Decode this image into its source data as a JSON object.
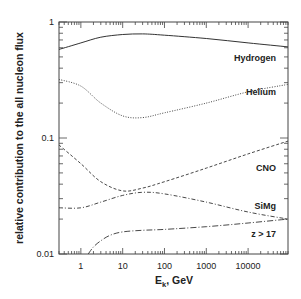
{
  "chart_data": {
    "type": "line",
    "title": "",
    "xlabel": "E_k,  GeV",
    "xlabel_main": "E",
    "xlabel_sub": "k",
    "xlabel_unit": ",  GeV",
    "ylabel": "relative contribution to the all nucleon flux",
    "xscale": "log",
    "yscale": "log",
    "xlim": [
      0.3,
      90000
    ],
    "ylim": [
      0.01,
      1
    ],
    "grid": false,
    "legend": "inline labels at right",
    "x_ticks": [
      {
        "value": 1,
        "label": "1"
      },
      {
        "value": 10,
        "label": "10"
      },
      {
        "value": 100,
        "label": "100"
      },
      {
        "value": 1000,
        "label": "1000"
      },
      {
        "value": 10000,
        "label": "10000"
      }
    ],
    "y_ticks": [
      {
        "value": 1,
        "label": "1"
      },
      {
        "value": 0.1,
        "label": "0.1"
      },
      {
        "value": 0.01,
        "label": "0.01"
      }
    ],
    "series": [
      {
        "name": "Hydrogen",
        "style": "solid",
        "label_pos": [
          0.42,
          0.49
        ],
        "x": [
          0.3,
          1,
          3,
          10,
          30,
          100,
          1000,
          10000,
          90000
        ],
        "y": [
          0.58,
          0.66,
          0.74,
          0.78,
          0.79,
          0.77,
          0.72,
          0.66,
          0.61
        ]
      },
      {
        "name": "Helium",
        "style": "dotted",
        "label_pos": [
          0.34,
          0.25
        ],
        "x": [
          0.3,
          1,
          3,
          10,
          30,
          100,
          1000,
          10000,
          90000
        ],
        "y": [
          0.32,
          0.28,
          0.2,
          0.155,
          0.15,
          0.165,
          0.2,
          0.25,
          0.29
        ]
      },
      {
        "name": "CNO",
        "style": "dashed",
        "label_pos": [
          0.11,
          0.055
        ],
        "x": [
          0.3,
          1,
          3,
          10,
          30,
          100,
          1000,
          10000,
          90000
        ],
        "y": [
          0.087,
          0.06,
          0.042,
          0.035,
          0.037,
          0.042,
          0.055,
          0.073,
          0.094
        ]
      },
      {
        "name": "SiMg",
        "style": "dash-dot",
        "label_pos": [
          0.26,
          0.026
        ],
        "x": [
          0.3,
          1,
          3,
          10,
          30,
          100,
          1000,
          10000,
          90000
        ],
        "y": [
          0.025,
          0.025,
          0.028,
          0.032,
          0.034,
          0.033,
          0.028,
          0.023,
          0.02
        ]
      },
      {
        "name": "z > 17",
        "style": "long-dash-dot",
        "label_pos": [
          0.26,
          0.015
        ],
        "x": [
          1.5,
          2,
          3,
          5,
          10,
          30,
          100,
          1000,
          10000,
          90000
        ],
        "y": [
          0.01,
          0.0115,
          0.013,
          0.0145,
          0.0155,
          0.016,
          0.0163,
          0.0172,
          0.0185,
          0.02
        ]
      }
    ]
  }
}
